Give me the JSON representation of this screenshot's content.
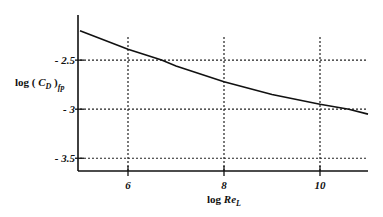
{
  "chart_data": {
    "type": "line",
    "title": "",
    "xlabel": "log Re_L",
    "ylabel": "log (C_D)_fp",
    "xlim": [
      5,
      11
    ],
    "ylim": [
      -3.63,
      -2.04
    ],
    "grid": true,
    "grid_style": "dotted",
    "x_ticks": [
      6,
      8,
      10
    ],
    "x_tick_labels": [
      "6",
      "8",
      "10"
    ],
    "y_ticks": [
      -2.5,
      -3,
      -3.5
    ],
    "y_tick_labels": [
      "- 2.5",
      "- 3",
      "- 3.5"
    ],
    "series": [
      {
        "name": "log (C_D)_fp",
        "color": "#111111",
        "x": [
          5,
          6,
          6.7,
          7,
          8,
          9,
          10,
          10.6,
          11
        ],
        "y": [
          -2.2,
          -2.39,
          -2.5,
          -2.56,
          -2.72,
          -2.85,
          -2.95,
          -3.0,
          -3.05
        ]
      }
    ],
    "legend": null
  },
  "labels": {
    "x_axis_main": "log ",
    "x_axis_var": "Re",
    "x_axis_sub": "L",
    "y_axis_main": "log ( ",
    "y_axis_var": "C",
    "y_axis_sub1": "D",
    "y_axis_close": " )",
    "y_axis_sub2": "fp"
  }
}
